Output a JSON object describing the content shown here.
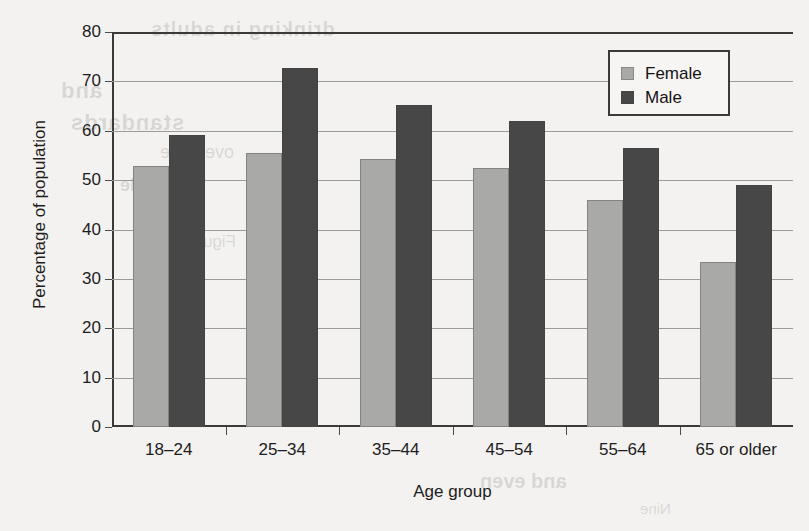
{
  "chart_data": {
    "type": "bar",
    "title": "",
    "xlabel": "Age group",
    "ylabel": "Percentage of population",
    "categories": [
      "18–24",
      "25–34",
      "35–44",
      "45–54",
      "55–64",
      "65 or older"
    ],
    "series": [
      {
        "name": "Female",
        "color": "#a9a9a7",
        "values": [
          52.8,
          55.5,
          54.2,
          52.5,
          46.0,
          33.5
        ]
      },
      {
        "name": "Male",
        "color": "#474747",
        "values": [
          59.2,
          72.7,
          65.3,
          62.0,
          56.5,
          49.0
        ]
      }
    ],
    "ylim": [
      0,
      80
    ],
    "yticks": [
      0,
      10,
      20,
      30,
      40,
      50,
      60,
      70,
      80
    ],
    "ytick_labels": [
      "0",
      "10",
      "20",
      "30",
      "40",
      "50",
      "60",
      "70",
      "80"
    ],
    "grid": true,
    "legend_position": "top-right"
  },
  "legend": {
    "entries": [
      {
        "label": "Female"
      },
      {
        "label": "Male"
      }
    ]
  },
  "page_bleed": {
    "lines": [
      "drinking in adults",
      "and",
      "standards",
      "over time",
      "and Male",
      "Figure 2.10",
      "and even",
      "Nine"
    ]
  }
}
